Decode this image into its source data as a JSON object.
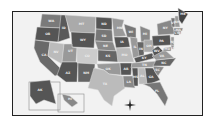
{
  "map": {
    "title": "United States",
    "states": [
      {
        "abbr": "WA",
        "shade": "#7a7a7a"
      },
      {
        "abbr": "OR",
        "shade": "#555"
      },
      {
        "abbr": "CA",
        "shade": "#6a6a6a"
      },
      {
        "abbr": "ID",
        "shade": "#5a5a5a"
      },
      {
        "abbr": "NV",
        "shade": "#bbb"
      },
      {
        "abbr": "MT",
        "shade": "#aaa"
      },
      {
        "abbr": "WY",
        "shade": "#555"
      },
      {
        "abbr": "UT",
        "shade": "#999"
      },
      {
        "abbr": "AZ",
        "shade": "#555"
      },
      {
        "abbr": "CO",
        "shade": "#ccc"
      },
      {
        "abbr": "NM",
        "shade": "#666"
      },
      {
        "abbr": "ND",
        "shade": "#555"
      },
      {
        "abbr": "SD",
        "shade": "#777"
      },
      {
        "abbr": "NE",
        "shade": "#888"
      },
      {
        "abbr": "KS",
        "shade": "#666"
      },
      {
        "abbr": "OK",
        "shade": "#999"
      },
      {
        "abbr": "TX",
        "shade": "#bbb"
      },
      {
        "abbr": "MN",
        "shade": "#999"
      },
      {
        "abbr": "IA",
        "shade": "#555"
      },
      {
        "abbr": "MO",
        "shade": "#bbb"
      },
      {
        "abbr": "AR",
        "shade": "#555"
      },
      {
        "abbr": "LA",
        "shade": "#888"
      },
      {
        "abbr": "WI",
        "shade": "#777"
      },
      {
        "abbr": "IL",
        "shade": "#999"
      },
      {
        "abbr": "MI",
        "shade": "#888"
      },
      {
        "abbr": "IN",
        "shade": "#666"
      },
      {
        "abbr": "OH",
        "shade": "#aaa"
      },
      {
        "abbr": "KY",
        "shade": "#555"
      },
      {
        "abbr": "TN",
        "shade": "#999"
      },
      {
        "abbr": "MS",
        "shade": "#555"
      },
      {
        "abbr": "AL",
        "shade": "#bbb"
      },
      {
        "abbr": "GA",
        "shade": "#555"
      },
      {
        "abbr": "FL",
        "shade": "#777"
      },
      {
        "abbr": "SC",
        "shade": "#888"
      },
      {
        "abbr": "NC",
        "shade": "#666"
      },
      {
        "abbr": "VA",
        "shade": "#999"
      },
      {
        "abbr": "WV",
        "shade": "#555"
      },
      {
        "abbr": "PA",
        "shade": "#555"
      },
      {
        "abbr": "NY",
        "shade": "#888"
      },
      {
        "abbr": "VT",
        "shade": "#777"
      },
      {
        "abbr": "NH",
        "shade": "#999"
      },
      {
        "abbr": "ME",
        "shade": "#444"
      },
      {
        "abbr": "MA",
        "shade": "#888"
      },
      {
        "abbr": "CT",
        "shade": "#666"
      },
      {
        "abbr": "RI",
        "shade": "#777"
      },
      {
        "abbr": "NJ",
        "shade": "#999"
      },
      {
        "abbr": "DE",
        "shade": "#777"
      },
      {
        "abbr": "MD",
        "shade": "#888"
      },
      {
        "abbr": "AK",
        "shade": "#555"
      },
      {
        "abbr": "HI",
        "shade": "#888"
      }
    ],
    "compass": "compass-rose"
  }
}
